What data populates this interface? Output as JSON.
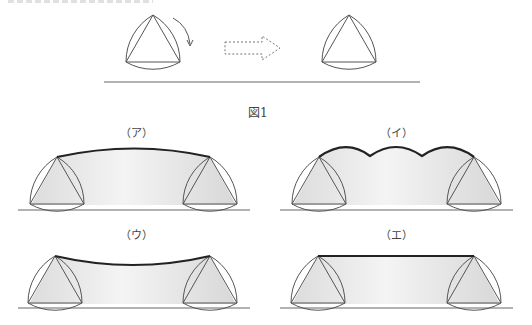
{
  "figure": {
    "caption": "図1",
    "arrow_hint": "rolling direction (dashed arrow)"
  },
  "panels": [
    {
      "id": "a",
      "label": "（ア）",
      "path_shape": "single convex arc"
    },
    {
      "id": "b",
      "label": "（イ）",
      "path_shape": "three scalloped arcs"
    },
    {
      "id": "c",
      "label": "（ウ）",
      "path_shape": "concave sagging curve"
    },
    {
      "id": "d",
      "label": "（エ）",
      "path_shape": "straight horizontal line"
    }
  ],
  "colors": {
    "stroke": "#555555",
    "path": "#222222",
    "shade": "#e6e6e6",
    "background": "#ffffff"
  }
}
